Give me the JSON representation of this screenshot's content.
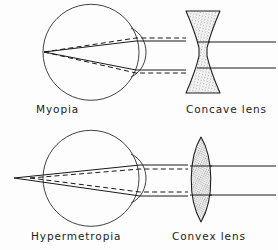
{
  "figure": {
    "background_color": "#fdfdfd",
    "line_color": "#1a1a1a",
    "stipple_color": "#555555",
    "width": 278,
    "height": 250
  },
  "panels": [
    {
      "id": "myopia",
      "condition_label": "Myopia",
      "lens_label": "Concave lens",
      "lens_type": "biconcave",
      "eye": {
        "center_x": 91,
        "center_y": 52,
        "radius": 48,
        "cornea_bulge": "right"
      },
      "focal_point": {
        "x": 44,
        "y": 52,
        "location": "inside-eye"
      },
      "rays": {
        "count": 2,
        "exit_y": [
          42,
          68
        ],
        "style": "solid-and-dashed-pairs"
      },
      "lens": {
        "x": 186,
        "y_top": 11,
        "y_bottom": 93,
        "waist_x": 203
      }
    },
    {
      "id": "hypermetropia",
      "condition_label": "Hypermetropia",
      "lens_label": "Convex lens",
      "lens_type": "biconvex",
      "eye": {
        "center_x": 91,
        "center_y": 178,
        "radius": 48,
        "cornea_bulge": "right"
      },
      "focal_point": {
        "x": 14,
        "y": 178,
        "location": "in-front-of-eye"
      },
      "rays": {
        "count": 2,
        "exit_y": [
          166,
          195
        ],
        "style": "solid-and-dashed-pairs"
      },
      "lens": {
        "x": 201,
        "y_top": 137,
        "y_bottom": 222,
        "half_width": 14
      }
    }
  ],
  "captions": {
    "myopia": "Myopia",
    "concave_lens": "Concave lens",
    "hypermetropia": "Hypermetropia",
    "convex_lens": "Convex lens"
  }
}
